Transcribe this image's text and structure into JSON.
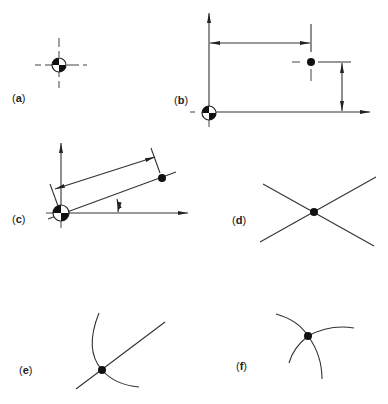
{
  "figure": {
    "panels": [
      {
        "id": "a",
        "label_open": "(",
        "label_letter": "a",
        "label_close": ")",
        "description": "datum symbol with centre lines"
      },
      {
        "id": "b",
        "label_open": "(",
        "label_letter": "b",
        "label_close": ")",
        "description": "rectangular coordinate dimensioning from datum"
      },
      {
        "id": "c",
        "label_open": "(",
        "label_letter": "c",
        "label_close": ")",
        "description": "polar coordinate dimensioning from datum"
      },
      {
        "id": "d",
        "label_open": "(",
        "label_letter": "d",
        "label_close": ")",
        "description": "point at intersection of two straight lines"
      },
      {
        "id": "e",
        "label_open": "(",
        "label_letter": "e",
        "label_close": ")",
        "description": "point at intersection of line and arc"
      },
      {
        "id": "f",
        "label_open": "(",
        "label_letter": "f",
        "label_close": ")",
        "description": "point at intersection of two arcs"
      }
    ],
    "colors": {
      "line": "#333333",
      "fill": "#111111",
      "background": "#ffffff"
    }
  }
}
